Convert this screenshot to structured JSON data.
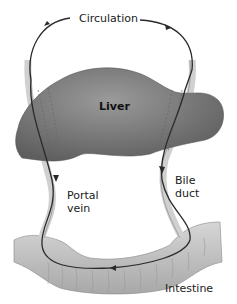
{
  "diagram": {
    "labels": {
      "circulation": "Circulation",
      "liver": "Liver",
      "bile_duct_line1": "Bile",
      "bile_duct_line2": "duct",
      "portal_vein_line1": "Portal",
      "portal_vein_line2": "vein",
      "intestine": "Intestine"
    },
    "colors": {
      "liver": "#7a7a7a",
      "vessel": "#cfcfcf",
      "path_line": "#2a2a2a",
      "intestine": "#bdbdbd"
    }
  }
}
